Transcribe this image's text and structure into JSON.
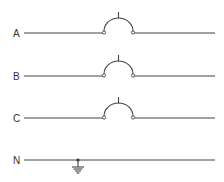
{
  "diagram": {
    "type": "single-line electrical diagram",
    "lines": [
      {
        "label": "A",
        "y": 33,
        "breaker": true
      },
      {
        "label": "B",
        "y": 76,
        "breaker": true
      },
      {
        "label": "C",
        "y": 118,
        "breaker": true
      },
      {
        "label": "N",
        "y": 160,
        "breaker": false,
        "ground": true
      }
    ],
    "colors": {
      "line": "#444444",
      "background": "#ffffff"
    }
  }
}
